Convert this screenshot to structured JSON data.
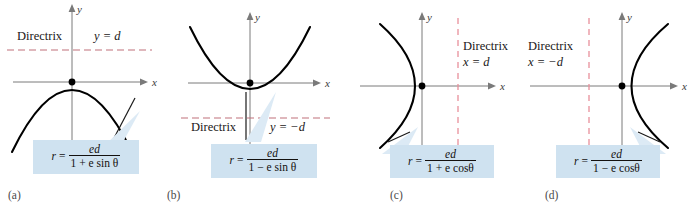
{
  "figure": {
    "background": "#ffffff",
    "curve_color": "#000000",
    "axis_color": "#6e6e6e",
    "directrix_color_horizontal": "#c0717a",
    "directrix_color_vertical": "#e8909b",
    "callout_fill": "#cfe2f0",
    "callout_tail_fill": "#dceaf5"
  },
  "panels": [
    {
      "id": "a",
      "letter": "(a)",
      "axis_x_label": "x",
      "axis_y_label": "y",
      "directrix_label": "Directrix",
      "directrix_equation": "y = d",
      "conic": "downward-opening parabola",
      "focus": "origin",
      "formula": {
        "lhs": "r",
        "equals": "=",
        "numerator": "ed",
        "denominator": "1 + e sin θ",
        "denominator_parts": [
          "1 + ",
          "e",
          " sin ",
          "θ"
        ]
      }
    },
    {
      "id": "b",
      "letter": "(b)",
      "axis_x_label": "x",
      "axis_y_label": "y",
      "directrix_label": "Directrix",
      "directrix_equation": "y = −d",
      "conic": "upward-opening parabola",
      "focus": "origin",
      "formula": {
        "lhs": "r",
        "equals": "=",
        "numerator": "ed",
        "denominator": "1 − e sin θ",
        "denominator_parts": [
          "1 − ",
          "e",
          " sin ",
          "θ"
        ]
      }
    },
    {
      "id": "c",
      "letter": "(c)",
      "axis_x_label": "x",
      "axis_y_label": "y",
      "directrix_label": "Directrix",
      "directrix_equation": "x = d",
      "conic": "left-opening parabola",
      "focus": "origin",
      "formula": {
        "lhs": "r",
        "equals": "=",
        "numerator": "ed",
        "denominator": "1 + e cosθ",
        "denominator_parts": [
          "1 + ",
          "e",
          " cos",
          "θ"
        ]
      }
    },
    {
      "id": "d",
      "letter": "(d)",
      "axis_x_label": "x",
      "axis_y_label": "y",
      "directrix_label": "Directrix",
      "directrix_equation": "x = −d",
      "conic": "right-opening parabola",
      "focus": "origin",
      "formula": {
        "lhs": "r",
        "equals": "=",
        "numerator": "ed",
        "denominator": "1 − e cosθ",
        "denominator_parts": [
          "1 − ",
          "e",
          " cos",
          "θ"
        ]
      }
    }
  ]
}
